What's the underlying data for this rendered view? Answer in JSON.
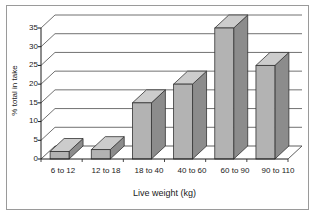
{
  "chart_data": {
    "type": "bar",
    "title": "",
    "subtitle": "",
    "xlabel": "Live weight (kg)",
    "ylabel": "% total in take",
    "categories": [
      "6 to 12",
      "12 to 18",
      "18 to 40",
      "40 to 60",
      "60 to 90",
      "90 to 110"
    ],
    "values": [
      2,
      2.5,
      15,
      20,
      35,
      25
    ],
    "series": [
      {
        "name": "% total in take",
        "values": [
          2,
          2.5,
          15,
          20,
          35,
          25
        ]
      }
    ],
    "ylim": [
      0,
      35
    ],
    "xlim": [
      0,
      6
    ],
    "yticks": [
      0,
      5,
      10,
      15,
      20,
      25,
      30,
      35
    ],
    "ytick_labels": [
      "0",
      "5",
      "10",
      "15",
      "20",
      "25",
      "30",
      "35"
    ],
    "grid": true,
    "grid_axis": "y",
    "legend": false,
    "legend_position": "none",
    "style": "3d-perspective",
    "annotations": [],
    "colors": {
      "bar_front": "#b3b3b3",
      "bar_top": "#cccccc",
      "bar_side": "#8c8c8c",
      "bar_outline": "#333333",
      "gridline": "#4d4d4d",
      "axis": "#1a1a1a",
      "frame": "#9a9a9a",
      "background": "#ffffff",
      "text": "#1a1a1a"
    }
  }
}
